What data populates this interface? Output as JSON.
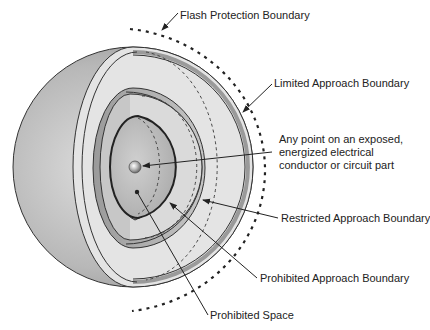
{
  "diagram": {
    "labels": {
      "flash_protection": "Flash Protection Boundary",
      "limited_approach": "Limited Approach Boundary",
      "exposed_point": "Any point on an exposed, energized electrical conductor or circuit part",
      "restricted_approach": "Restricted Approach Boundary",
      "prohibited_approach": "Prohibited Approach Boundary",
      "prohibited_space": "Prohibited Space"
    },
    "boundaries_outer_to_inner": [
      "Flash Protection Boundary",
      "Limited Approach Boundary",
      "Restricted Approach Boundary",
      "Prohibited Approach Boundary",
      "Prohibited Space"
    ],
    "colors": {
      "sphere_dark": "#8c8c8c",
      "sphere_mid": "#b4b4b4",
      "sphere_light": "#e2e2e2",
      "outline": "#333333",
      "text": "#222222"
    }
  }
}
